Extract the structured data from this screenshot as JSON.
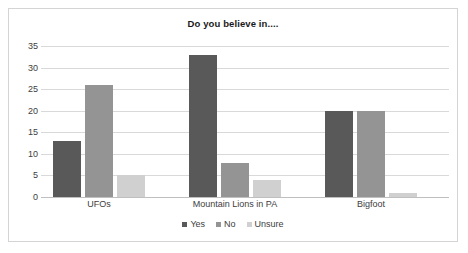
{
  "chart_data": {
    "type": "bar",
    "title": "Do you believe in....",
    "xlabel": "",
    "ylabel": "",
    "categories": [
      "UFOs",
      "Mountain Lions in PA",
      "Bigfoot"
    ],
    "series": [
      {
        "name": "Yes",
        "values": [
          13,
          33,
          20
        ],
        "color": "#595959"
      },
      {
        "name": "No",
        "values": [
          26,
          8,
          20
        ],
        "color": "#949494"
      },
      {
        "name": "Unsure",
        "values": [
          5,
          4,
          1
        ],
        "color": "#d0d0d0"
      }
    ],
    "ylim": [
      0,
      35
    ],
    "yticks": [
      0,
      5,
      10,
      15,
      20,
      25,
      30,
      35
    ],
    "ytick_labels": [
      "0",
      "5",
      "10",
      "15",
      "20",
      "25",
      "30",
      "35"
    ],
    "grid": true,
    "grid_color": "#d9d9d9",
    "legend_position": "bottom",
    "border_color": "#d4d4d4",
    "background": "#ffffff"
  }
}
